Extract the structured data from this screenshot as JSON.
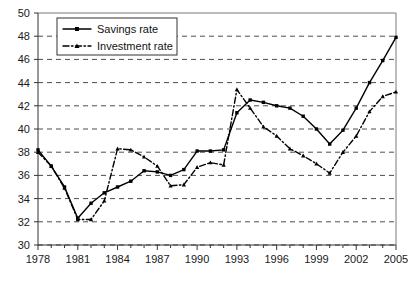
{
  "chart_data": {
    "type": "line",
    "title": "",
    "xlabel": "",
    "ylabel": "",
    "xlim": [
      1978,
      2005
    ],
    "ylim": [
      30,
      50
    ],
    "grid": true,
    "legend_position": "top-left",
    "y_ticks": [
      30,
      32,
      34,
      36,
      38,
      40,
      42,
      44,
      46,
      48,
      50
    ],
    "x_ticks": [
      1978,
      1981,
      1984,
      1987,
      1990,
      1993,
      1996,
      1999,
      2002,
      2005
    ],
    "x_tick_labels": [
      "1978",
      "1981",
      "1984",
      "1987",
      "1990",
      "1993",
      "1996",
      "1999",
      "2002",
      "2005"
    ],
    "y_tick_labels": [
      "30",
      "32",
      "34",
      "36",
      "38",
      "40",
      "42",
      "44",
      "46",
      "48",
      "50"
    ],
    "x_minor_ticks": [
      1978,
      1979,
      1980,
      1981,
      1982,
      1983,
      1984,
      1985,
      1986,
      1987,
      1988,
      1989,
      1990,
      1991,
      1992,
      1993,
      1994,
      1995,
      1996,
      1997,
      1998,
      1999,
      2000,
      2001,
      2002,
      2003,
      2004,
      2005
    ],
    "x": [
      1978,
      1979,
      1980,
      1981,
      1982,
      1983,
      1984,
      1985,
      1986,
      1987,
      1988,
      1989,
      1990,
      1991,
      1992,
      1993,
      1994,
      1995,
      1996,
      1997,
      1998,
      1999,
      2000,
      2001,
      2002,
      2003,
      2004,
      2005
    ],
    "series": [
      {
        "name": "Savings rate",
        "style": "solid",
        "marker": "square",
        "values": [
          38.2,
          36.8,
          35.0,
          32.3,
          33.6,
          34.5,
          35.0,
          35.5,
          36.4,
          36.3,
          36.0,
          36.5,
          38.1,
          38.1,
          38.2,
          41.4,
          42.5,
          42.3,
          42.0,
          41.8,
          41.1,
          40.0,
          38.7,
          39.9,
          41.8,
          44.0,
          45.9,
          47.9
        ]
      },
      {
        "name": "Investment rate",
        "style": "dashed",
        "marker": "triangle",
        "values": [
          38.0,
          36.8,
          34.9,
          32.2,
          32.2,
          33.8,
          38.3,
          38.2,
          37.6,
          36.8,
          35.1,
          35.2,
          36.7,
          37.1,
          36.9,
          43.4,
          41.8,
          40.2,
          39.4,
          38.3,
          37.7,
          37.0,
          36.2,
          38.0,
          39.4,
          41.5,
          42.8,
          43.2
        ]
      }
    ]
  },
  "legend": {
    "entries": [
      {
        "label": "Savings rate"
      },
      {
        "label": "Investment rate"
      }
    ]
  }
}
